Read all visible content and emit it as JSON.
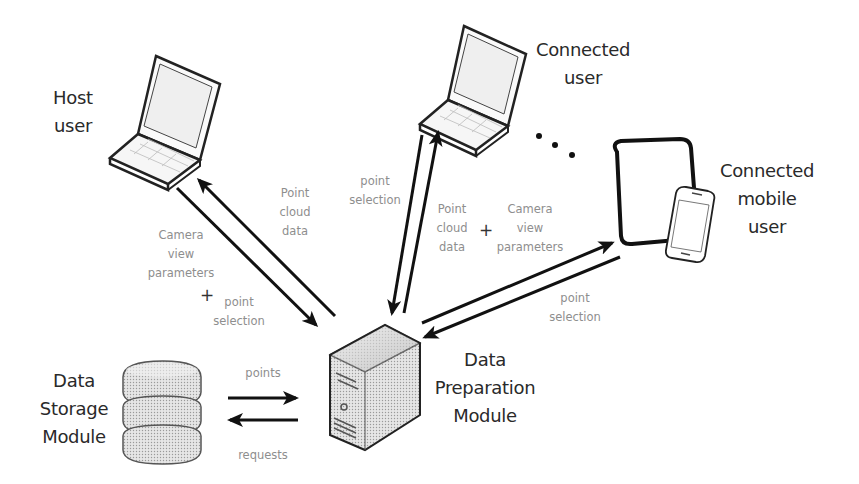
{
  "diagram": {
    "nodes": {
      "host_user": {
        "lines": [
          "Host",
          "user"
        ]
      },
      "connected_user": {
        "lines": [
          "Connected",
          "user"
        ]
      },
      "connected_mobile_user": {
        "lines": [
          "Connected",
          "mobile",
          "user"
        ]
      },
      "data_storage_module": {
        "lines": [
          "Data",
          "Storage",
          "Module"
        ]
      },
      "data_preparation_module": {
        "lines": [
          "Data",
          "Preparation",
          "Module"
        ]
      }
    },
    "ellipsis": "• • •",
    "edges": {
      "host_to_server": {
        "lines": [
          "Camera",
          "view",
          "parameters"
        ],
        "plus": "+",
        "extra_lines": [
          "point",
          "selection"
        ]
      },
      "server_to_host": {
        "lines": [
          "Point",
          "cloud",
          "data"
        ]
      },
      "connected_to_server": {
        "lines": [
          "point",
          "selection"
        ]
      },
      "server_to_connected_and_mobile": {
        "left_lines": [
          "Point",
          "cloud",
          "data"
        ],
        "plus": "+",
        "right_lines": [
          "Camera",
          "view",
          "parameters"
        ]
      },
      "mobile_to_server": {
        "lines": [
          "point",
          "selection"
        ]
      },
      "storage_to_server": {
        "lines": [
          "points"
        ]
      },
      "server_to_storage": {
        "lines": [
          "requests"
        ]
      }
    },
    "colors": {
      "stroke": "#111111",
      "node_text": "#2a2a2a",
      "edge_text": "#8e8e8e",
      "device_fill": "#eeeeee"
    }
  }
}
